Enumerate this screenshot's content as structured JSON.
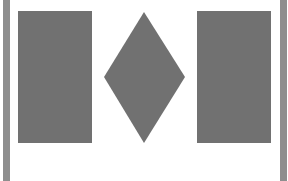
{
  "colors": {
    "background": "#ffffff",
    "shape_fill": "#717171",
    "side_bar": "#8e8e8e"
  },
  "shapes": [
    {
      "type": "side-bar",
      "position": "left"
    },
    {
      "type": "rectangle",
      "position": "left"
    },
    {
      "type": "diamond",
      "position": "center"
    },
    {
      "type": "rectangle",
      "position": "right"
    },
    {
      "type": "side-bar",
      "position": "right"
    }
  ]
}
